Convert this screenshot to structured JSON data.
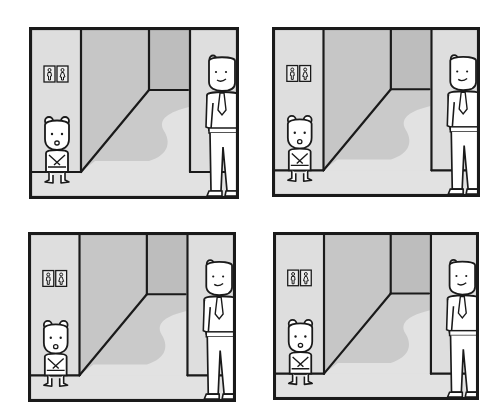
{
  "comic": {
    "title": "",
    "layout": "2x2 grid",
    "panels": [
      {
        "id": 1,
        "scene": "hallway-by-restrooms",
        "small_bear_expression": "mouth-open",
        "tall_figure_expression": "smirk"
      },
      {
        "id": 2,
        "scene": "hallway-by-restrooms",
        "small_bear_expression": "mouth-open",
        "tall_figure_expression": "smirk"
      },
      {
        "id": 3,
        "scene": "hallway-by-restrooms",
        "small_bear_expression": "mouth-open",
        "tall_figure_expression": "smirk"
      },
      {
        "id": 4,
        "scene": "hallway-by-restrooms",
        "small_bear_expression": "mouth-open",
        "tall_figure_expression": "smirk"
      }
    ],
    "restroom_sign": {
      "icons": [
        "male-restroom-icon",
        "female-restroom-icon"
      ]
    },
    "colors": {
      "page_bg": "#ffffff",
      "ink": "#1a1a1a",
      "wall_light": "#dedede",
      "hall_wall": "#c6c6c6",
      "hall_back": "#bdbdbd",
      "shadow": "#cacaca",
      "floor": "#e2e2e2",
      "character_fill": "#ffffff"
    }
  }
}
